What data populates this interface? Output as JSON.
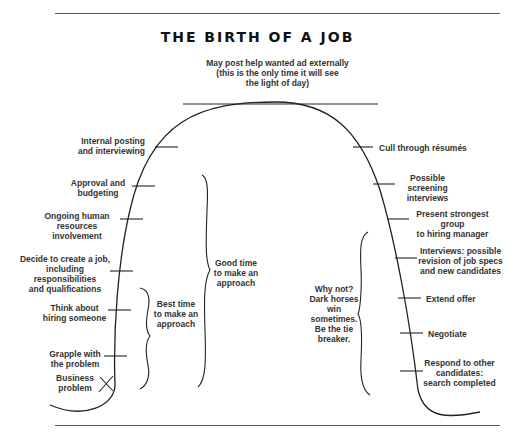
{
  "title": "THE BIRTH OF A JOB",
  "top_label": "May post help wanted ad externally (this is the only time it will see the light of day)",
  "top_label_lines": [
    "May post help wanted ad externally",
    "(this is the only time it will see",
    "the light of day)"
  ],
  "left_steps": [
    {
      "lines": [
        "Internal posting",
        "and interviewing"
      ]
    },
    {
      "lines": [
        "Approval and",
        "budgeting"
      ]
    },
    {
      "lines": [
        "Ongoing human",
        "resources involvement"
      ]
    },
    {
      "lines": [
        "Decide to create a job,",
        "including responsibilities",
        "and qualifications"
      ]
    },
    {
      "lines": [
        "Think about",
        "hiring someone"
      ]
    },
    {
      "lines": [
        "Grapple with",
        "the problem"
      ]
    },
    {
      "lines": [
        "Business",
        "problem"
      ]
    }
  ],
  "right_steps": [
    {
      "lines": [
        "Cull through résumés"
      ]
    },
    {
      "lines": [
        "Possible screening",
        "interviews"
      ]
    },
    {
      "lines": [
        "Present strongest group",
        "to hiring manager"
      ]
    },
    {
      "lines": [
        "Interviews: possible",
        "revision of job specs",
        "and new candidates"
      ]
    },
    {
      "lines": [
        "Extend offer"
      ]
    },
    {
      "lines": [
        "Negotiate"
      ]
    },
    {
      "lines": [
        "Respond to other",
        "candidates:",
        "search completed"
      ]
    }
  ],
  "brackets": {
    "best_time": [
      "Best time",
      "to make an",
      "approach"
    ],
    "good_time": [
      "Good time",
      "to make an",
      "approach"
    ],
    "why_not": [
      "Why not?",
      "Dark horses",
      "win",
      "sometimes.",
      "Be the tie",
      "breaker."
    ]
  }
}
